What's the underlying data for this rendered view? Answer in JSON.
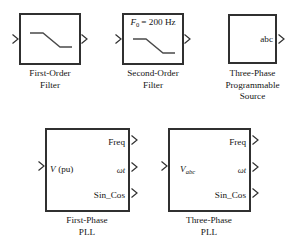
{
  "diagram": {
    "background_color": "#ffffff",
    "line_color": "#303030",
    "text_color": "#151515"
  },
  "blocks": [
    {
      "id": "first-order-filter",
      "caption_lines": [
        "First-Order",
        "Filter"
      ],
      "inner_text": "",
      "icon": "lowpass-curve",
      "inputs": [
        "in"
      ],
      "outputs": [
        "out"
      ],
      "box": {
        "x": 19,
        "y": 13,
        "w": 62,
        "h": 52
      }
    },
    {
      "id": "second-order-filter",
      "caption_lines": [
        "Second-Order",
        "Filter"
      ],
      "inner_text": "F0 = 200 Hz",
      "inner_text_parts": {
        "symbol": "F",
        "subscript": "0",
        "equals": "= 200 Hz"
      },
      "icon": "lowpass-curve",
      "inputs": [
        "in"
      ],
      "outputs": [
        "out"
      ],
      "box": {
        "x": 122,
        "y": 13,
        "w": 62,
        "h": 52
      }
    },
    {
      "id": "three-phase-programmable-source",
      "caption_lines": [
        "Three-Phase",
        "Programmable",
        "Source"
      ],
      "inner_text": "abc",
      "icon": "none",
      "inputs": [],
      "outputs": [
        "abc"
      ],
      "box": {
        "x": 228,
        "y": 14,
        "w": 49,
        "h": 50
      }
    },
    {
      "id": "first-phase-pll",
      "caption_lines": [
        "First-Phase",
        "PLL"
      ],
      "input_label": "V (pu)",
      "input_label_parts": {
        "symbol": "V",
        "rest": " (pu)"
      },
      "output_labels": [
        "Freq",
        "ωt",
        "Sin_Cos"
      ],
      "box": {
        "x": 45,
        "y": 128,
        "w": 85,
        "h": 84
      }
    },
    {
      "id": "three-phase-pll",
      "caption_lines": [
        "Three-Phase",
        "PLL"
      ],
      "input_label": "Vabc",
      "input_label_parts": {
        "symbol": "V",
        "subscript": "abc"
      },
      "output_labels": [
        "Freq",
        "ωt",
        "Sin_Cos"
      ],
      "box": {
        "x": 168,
        "y": 128,
        "w": 83,
        "h": 84
      }
    }
  ],
  "labels": {
    "f0_symbol": "F",
    "f0_sub": "0",
    "f0_rest": "= 200 Hz",
    "abc": "abc",
    "v_pu_symbol": "V",
    "v_pu_rest": "(pu)",
    "vabc_symbol": "V",
    "vabc_sub": "abc",
    "freq": "Freq",
    "omega_t": "ωt",
    "sin_cos": "Sin_Cos",
    "cap_first_order_1": "First-Order",
    "cap_first_order_2": "Filter",
    "cap_second_order_1": "Second-Order",
    "cap_second_order_2": "Filter",
    "cap_source_1": "Three-Phase",
    "cap_source_2": "Programmable",
    "cap_source_3": "Source",
    "cap_pll1_1": "First-Phase",
    "cap_pll1_2": "PLL",
    "cap_pll3_1": "Three-Phase",
    "cap_pll3_2": "PLL"
  },
  "icons": {
    "port_arrow": "port-arrow-icon",
    "lowpass_curve": "lowpass-filter-curve-icon"
  }
}
